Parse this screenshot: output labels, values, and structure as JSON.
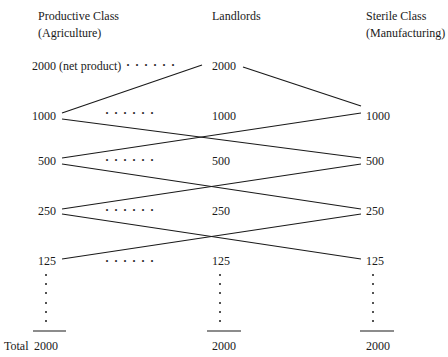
{
  "headers": {
    "productive": [
      "Productive Class",
      "(Agriculture)"
    ],
    "landlords": [
      "Landlords"
    ],
    "sterile": [
      "Sterile Class",
      "(Manufacturing)"
    ]
  },
  "rows": [
    {
      "productive": "2000 (net product)",
      "landlords": "2000",
      "sterile": ""
    },
    {
      "productive": "1000",
      "landlords": "1000",
      "sterile": "1000"
    },
    {
      "productive": "500",
      "landlords": "500",
      "sterile": "500"
    },
    {
      "productive": "250",
      "landlords": "250",
      "sterile": "250"
    },
    {
      "productive": "125",
      "landlords": "125",
      "sterile": "125"
    }
  ],
  "dot_leader": "· · · · · ·",
  "totals": {
    "label": "Total",
    "productive": "2000",
    "landlords": "2000",
    "sterile": "2000"
  },
  "flows": [
    {
      "from": "productive.1000",
      "to": "landlords.2000"
    },
    {
      "from": "landlords.2000",
      "to": "sterile.1000"
    },
    {
      "from": "productive.1000",
      "to": "sterile.500"
    },
    {
      "from": "sterile.1000",
      "to": "productive.500"
    },
    {
      "from": "productive.500",
      "to": "sterile.250"
    },
    {
      "from": "sterile.500",
      "to": "productive.250"
    },
    {
      "from": "productive.250",
      "to": "sterile.125"
    },
    {
      "from": "sterile.250",
      "to": "productive.125"
    }
  ]
}
